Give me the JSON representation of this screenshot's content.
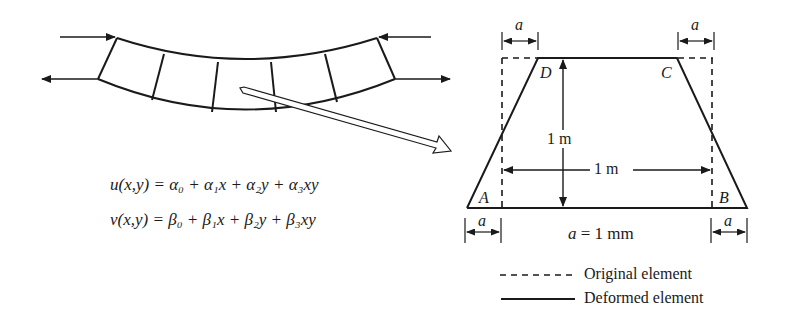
{
  "equations": {
    "u": "u(x,y) = α₀ + α₁x + α₂y + α₃xy",
    "v": "v(x,y) = β₀ + β₁x + β₂y + β₃xy"
  },
  "element": {
    "corners": {
      "A": "A",
      "B": "B",
      "C": "C",
      "D": "D"
    },
    "offset_label": "a",
    "height_label": "1 m",
    "width_label": "1 m",
    "a_value": "a = 1 mm"
  },
  "legend": {
    "original": "Original element",
    "deformed": "Deformed element"
  },
  "colors": {
    "line": "#1a1a1a",
    "background": "#ffffff"
  }
}
